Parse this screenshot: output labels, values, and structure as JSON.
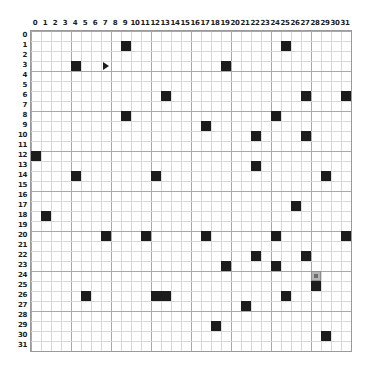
{
  "board": {
    "title": "Grid World",
    "columns": 32,
    "rows": 32,
    "cell_size_px": 10,
    "col_labels": [
      "0",
      "1",
      "2",
      "3",
      "4",
      "5",
      "6",
      "7",
      "8",
      "9",
      "10",
      "11",
      "12",
      "13",
      "14",
      "15",
      "16",
      "17",
      "18",
      "19",
      "20",
      "21",
      "22",
      "23",
      "24",
      "25",
      "26",
      "27",
      "28",
      "29",
      "30",
      "31"
    ],
    "row_labels": [
      "0",
      "1",
      "2",
      "3",
      "4",
      "5",
      "6",
      "7",
      "8",
      "9",
      "10",
      "11",
      "12",
      "13",
      "14",
      "15",
      "16",
      "17",
      "18",
      "19",
      "20",
      "21",
      "22",
      "23",
      "24",
      "25",
      "26",
      "27",
      "28",
      "29",
      "30",
      "31"
    ],
    "colors": {
      "wall": "#1c1c1c",
      "grid_line_minor": "#d8d8d8",
      "grid_line_major": "#a8a8a8",
      "border": "#9a9a9a",
      "background": "#ffffff",
      "target_fill": "#b4b4b4",
      "target_border": "#8c8c8c",
      "label_text": "#1a1a1a"
    },
    "walls": [
      {
        "col": 9,
        "row": 1
      },
      {
        "col": 25,
        "row": 1
      },
      {
        "col": 4,
        "row": 3
      },
      {
        "col": 19,
        "row": 3
      },
      {
        "col": 13,
        "row": 6
      },
      {
        "col": 27,
        "row": 6
      },
      {
        "col": 31,
        "row": 6
      },
      {
        "col": 9,
        "row": 8
      },
      {
        "col": 24,
        "row": 8
      },
      {
        "col": 17,
        "row": 9
      },
      {
        "col": 22,
        "row": 10
      },
      {
        "col": 27,
        "row": 10
      },
      {
        "col": 0,
        "row": 12
      },
      {
        "col": 22,
        "row": 13
      },
      {
        "col": 4,
        "row": 14
      },
      {
        "col": 12,
        "row": 14
      },
      {
        "col": 29,
        "row": 14
      },
      {
        "col": 26,
        "row": 17
      },
      {
        "col": 1,
        "row": 18
      },
      {
        "col": 7,
        "row": 20
      },
      {
        "col": 11,
        "row": 20
      },
      {
        "col": 17,
        "row": 20
      },
      {
        "col": 24,
        "row": 20
      },
      {
        "col": 31,
        "row": 20
      },
      {
        "col": 22,
        "row": 22
      },
      {
        "col": 27,
        "row": 22
      },
      {
        "col": 19,
        "row": 23
      },
      {
        "col": 24,
        "row": 23
      },
      {
        "col": 28,
        "row": 25
      },
      {
        "col": 5,
        "row": 26
      },
      {
        "col": 12,
        "row": 26
      },
      {
        "col": 13,
        "row": 26
      },
      {
        "col": 25,
        "row": 26
      },
      {
        "col": 21,
        "row": 27
      },
      {
        "col": 18,
        "row": 29
      },
      {
        "col": 29,
        "row": 30
      }
    ],
    "target": {
      "col": 28,
      "row": 24,
      "name": "goal-cell"
    },
    "agent": {
      "col": 7,
      "row": 3,
      "facing": "right",
      "glyph": "right-triangle"
    }
  }
}
